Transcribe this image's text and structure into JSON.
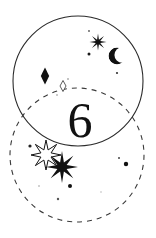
{
  "canvas": {
    "width": 156,
    "height": 238,
    "background_color": "#ffffff",
    "ink_color": "#1a1a1a"
  },
  "artwork": {
    "title": "Celestial Venn Composition",
    "numeral": {
      "text": "6",
      "center_x": 80,
      "baseline_y": 137,
      "font_size": 50,
      "color": "#111111"
    },
    "circles": [
      {
        "name": "upper-solid-circle",
        "style": "solid",
        "center_x": 78,
        "center_y": 81,
        "radius": 65,
        "stroke_color": "#2b2b2b",
        "stroke_width": 1.1,
        "fill": "none"
      },
      {
        "name": "lower-dashed-circle",
        "style": "dashed",
        "center_x": 77,
        "center_y": 155,
        "radius": 67,
        "stroke_color": "#3a3a3a",
        "stroke_width": 1.1,
        "dash_pattern": "5 5",
        "fill": "none"
      }
    ],
    "stars": [
      {
        "name": "star-upper-right",
        "shape": "eight-point-star",
        "center_x": 98,
        "center_y": 42,
        "outer_radius": 8.5,
        "inner_radius": 2.4,
        "fill": "#111111",
        "stroke": "none"
      },
      {
        "name": "starburst-outline-lower-left",
        "shape": "eight-point-star",
        "center_x": 46,
        "center_y": 155,
        "outer_radius": 15,
        "inner_radius": 5.5,
        "fill": "#ffffff",
        "stroke": "#111111"
      },
      {
        "name": "star-solid-lower-left",
        "shape": "eight-point-star",
        "center_x": 62,
        "center_y": 167,
        "outer_radius": 16,
        "inner_radius": 5.0,
        "fill": "#111111",
        "stroke": "none"
      }
    ],
    "moon": {
      "name": "crescent-moon",
      "center_x": 117,
      "center_y": 56,
      "radius": 8.5,
      "fill": "#111111",
      "opening": "right"
    },
    "diamonds": [
      {
        "name": "diamond-solid-left",
        "center_x": 45,
        "center_y": 76,
        "half_width": 4.2,
        "half_height": 8.5,
        "fill": "#111111",
        "stroke": "none"
      },
      {
        "name": "diamond-outline-center",
        "center_x": 63,
        "center_y": 86,
        "half_width": 3.0,
        "half_height": 5.5,
        "fill": "#ffffff",
        "stroke": "#333333"
      }
    ],
    "dots": [
      {
        "name": "dot-1",
        "cx": 89,
        "cy": 31,
        "r": 0.9,
        "fill": "#555555"
      },
      {
        "name": "dot-2",
        "cx": 89,
        "cy": 54,
        "r": 1.5,
        "fill": "#1a1a1a"
      },
      {
        "name": "dot-3",
        "cx": 117,
        "cy": 73,
        "r": 1.1,
        "fill": "#333333"
      },
      {
        "name": "dot-4",
        "cx": 68,
        "cy": 79,
        "r": 0.8,
        "fill": "#777777"
      },
      {
        "name": "dot-5",
        "cx": 57,
        "cy": 95,
        "r": 0.8,
        "fill": "#888888"
      },
      {
        "name": "dot-6",
        "cx": 30,
        "cy": 146,
        "r": 1.6,
        "fill": "#222222"
      },
      {
        "name": "dot-7",
        "cx": 126,
        "cy": 164,
        "r": 2.2,
        "fill": "#111111"
      },
      {
        "name": "dot-8",
        "cx": 119,
        "cy": 158,
        "r": 1.0,
        "fill": "#444444"
      },
      {
        "name": "dot-9",
        "cx": 70,
        "cy": 186,
        "r": 2.0,
        "fill": "#111111"
      },
      {
        "name": "dot-10",
        "cx": 58,
        "cy": 199,
        "r": 1.2,
        "fill": "#555555"
      },
      {
        "name": "dot-11",
        "cx": 39,
        "cy": 186,
        "r": 0.8,
        "fill": "#999999"
      },
      {
        "name": "dot-12",
        "cx": 101,
        "cy": 192,
        "r": 0.7,
        "fill": "#aaaaaa"
      }
    ]
  }
}
